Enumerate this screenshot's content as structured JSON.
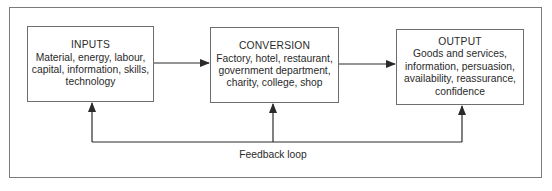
{
  "diagram": {
    "type": "flow",
    "nodes": [
      {
        "id": "inputs",
        "title": "INPUTS",
        "lines": [
          "Material, energy, labour,",
          "capital, information, skills,",
          "technology"
        ]
      },
      {
        "id": "conversion",
        "title": "CONVERSION",
        "lines": [
          "Factory, hotel, restaurant,",
          "government department,",
          "charity, college, shop"
        ]
      },
      {
        "id": "output",
        "title": "OUTPUT",
        "lines": [
          "Goods and services,",
          "information, persuasion,",
          "availability, reassurance,",
          "confidence"
        ]
      }
    ],
    "edges": [
      {
        "from": "inputs",
        "to": "conversion"
      },
      {
        "from": "conversion",
        "to": "output"
      },
      {
        "from": "feedback-loop",
        "to": "inputs"
      },
      {
        "from": "feedback-loop",
        "to": "conversion"
      },
      {
        "from": "feedback-loop",
        "to": "output"
      }
    ],
    "feedback_label": "Feedback loop",
    "colors": {
      "line": "#2a2a2a",
      "box_border": "#6e6e6e",
      "frame_border": "#7a7a7a"
    }
  }
}
